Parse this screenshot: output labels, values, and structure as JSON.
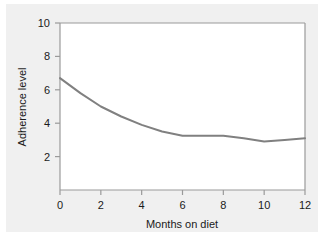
{
  "chart_data": {
    "type": "line",
    "title": "",
    "xlabel": "Months on diet",
    "ylabel": "Adherence level",
    "x": [
      0,
      1,
      2,
      3,
      4,
      5,
      6,
      7,
      8,
      9,
      10,
      11,
      12
    ],
    "values": [
      6.7,
      5.8,
      5.0,
      4.4,
      3.9,
      3.5,
      3.25,
      3.25,
      3.25,
      3.1,
      2.9,
      3.0,
      3.1
    ],
    "series": [
      {
        "name": "Adherence level",
        "values": [
          6.7,
          5.8,
          5.0,
          4.4,
          3.9,
          3.5,
          3.25,
          3.25,
          3.25,
          3.1,
          2.9,
          3.0,
          3.1
        ]
      }
    ],
    "xlim": [
      0,
      12
    ],
    "ylim": [
      0,
      10
    ],
    "xticks": [
      0,
      2,
      4,
      6,
      8,
      10,
      12
    ],
    "yticks": [
      2,
      4,
      6,
      8,
      10
    ],
    "xtick_labels": [
      "0",
      "2",
      "4",
      "6",
      "8",
      "10",
      "12"
    ],
    "ytick_labels": [
      "2",
      "4",
      "6",
      "8",
      "10"
    ],
    "grid": false,
    "legend": "none",
    "line_color": "#808080",
    "axis_color": "#9a9a9a",
    "plot_bg": "#ffffff",
    "figure_bg": "#f0f0f0",
    "text_color": "#1a1a1a"
  }
}
